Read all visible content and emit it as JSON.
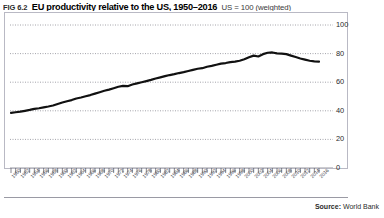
{
  "figure": {
    "fig_number": "FIG 6.2",
    "title": "EU productivity relative to the US, 1950–2016",
    "subtitle": "US = 100 (weighted)",
    "source_label": "Source:",
    "source_name": "World Bank"
  },
  "chart_data": {
    "type": "line",
    "title": "EU productivity relative to the US, 1950–2016",
    "subtitle": "US = 100 (weighted)",
    "xlabel": "",
    "ylabel": "US = 100 (weighted)",
    "ylim": [
      0,
      100
    ],
    "yticks": [
      0,
      20,
      40,
      60,
      80,
      100
    ],
    "y_axis_position": "right",
    "grid": "horizontal-dotted",
    "legend": "none",
    "xlim": [
      1950,
      2016
    ],
    "x_tick_rotation": -46,
    "series": [
      {
        "name": "EU productivity relative to US",
        "color": "#111111",
        "x": [
          1950,
          1951,
          1952,
          1953,
          1954,
          1955,
          1956,
          1957,
          1958,
          1959,
          1960,
          1961,
          1962,
          1963,
          1964,
          1965,
          1966,
          1967,
          1968,
          1969,
          1970,
          1971,
          1972,
          1973,
          1974,
          1975,
          1976,
          1977,
          1978,
          1979,
          1980,
          1981,
          1982,
          1983,
          1984,
          1985,
          1986,
          1987,
          1988,
          1989,
          1990,
          1991,
          1992,
          1993,
          1994,
          1995,
          1996,
          1997,
          1998,
          1999,
          2000,
          2001,
          2002,
          2003,
          2004,
          2005,
          2006,
          2007,
          2008,
          2009,
          2010,
          2011,
          2012,
          2013,
          2014,
          2015,
          2016
        ],
        "values": [
          38.5,
          39.0,
          39.4,
          40.0,
          40.6,
          41.3,
          41.8,
          42.4,
          43.0,
          43.7,
          44.8,
          45.8,
          46.7,
          47.5,
          48.6,
          49.3,
          50.2,
          51.0,
          52.0,
          53.0,
          54.0,
          54.8,
          55.8,
          56.8,
          57.4,
          57.2,
          58.4,
          59.2,
          60.0,
          60.8,
          61.6,
          62.6,
          63.4,
          64.2,
          65.0,
          65.6,
          66.4,
          67.0,
          67.8,
          68.6,
          69.4,
          69.8,
          70.8,
          71.4,
          72.2,
          73.0,
          73.4,
          74.0,
          74.4,
          75.0,
          76.0,
          77.4,
          78.6,
          78.0,
          79.6,
          80.6,
          80.8,
          80.2,
          80.0,
          79.6,
          78.6,
          77.6,
          76.6,
          75.8,
          75.0,
          74.6,
          74.4
        ]
      }
    ],
    "x_tick_labels": [
      "1950",
      "1951",
      "1952",
      "1953",
      "1954",
      "1955",
      "1956",
      "1957",
      "1958",
      "1959",
      "1960",
      "1961",
      "1962",
      "1963",
      "1964",
      "1965",
      "1966",
      "1967",
      "1968",
      "1969",
      "1970",
      "1971",
      "1972",
      "1973",
      "1974",
      "1975",
      "1976",
      "1977",
      "1978",
      "1979",
      "1980",
      "1981",
      "1982",
      "1983",
      "1984",
      "1985",
      "1986",
      "1987",
      "1988",
      "1989",
      "1990",
      "1991",
      "1992",
      "1993",
      "1994",
      "1995",
      "1996",
      "1997",
      "1998",
      "1999",
      "2000",
      "2001",
      "2002",
      "2003",
      "2004",
      "2005",
      "2006",
      "2007",
      "2008",
      "2009",
      "2010",
      "2011",
      "2012",
      "2013",
      "2014",
      "2015",
      "2016"
    ],
    "x_tick_label_step": 2
  },
  "colors": {
    "line": "#111111",
    "grid": "#8d8d96",
    "frame": "#b9b9c4",
    "text": "#1a1a1a"
  }
}
